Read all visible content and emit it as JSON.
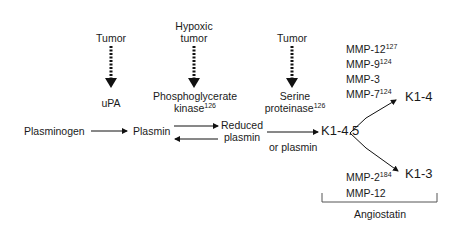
{
  "diagram": {
    "sources": [
      {
        "label": "Tumor",
        "product": "uPA",
        "product_sup": ""
      },
      {
        "label_line1": "Hypoxic",
        "label_line2": "tumor",
        "product_line1": "Phosphoglycerate",
        "product_line2": "kinase",
        "product_sup": "126"
      },
      {
        "label": "Tumor",
        "product_line1": "Serine",
        "product_line2": "proteinase",
        "product_sup": "126"
      }
    ],
    "pathway": {
      "plasminogen": "Plasminogen",
      "plasmin": "Plasmin",
      "reduced_line1": "Reduced",
      "reduced_line2": "plasmin",
      "or_plasmin": "or plasmin",
      "k145": "K1-4.5",
      "k14": "K1-4",
      "k13": "K1-3"
    },
    "mmp_upper": [
      {
        "name": "MMP-12",
        "sup": "127"
      },
      {
        "name": "MMP-9",
        "sup": "124"
      },
      {
        "name": "MMP-3",
        "sup": ""
      },
      {
        "name": "MMP-7",
        "sup": "124"
      }
    ],
    "mmp_lower": [
      {
        "name": "MMP-2",
        "sup": "184"
      },
      {
        "name": "MMP-12",
        "sup": ""
      }
    ],
    "bracket_label": "Angiostatin"
  }
}
